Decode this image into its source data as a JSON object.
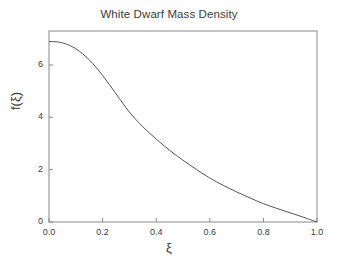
{
  "chart_data": {
    "type": "line",
    "title": "White Dwarf Mass Density",
    "xlabel": "ξ",
    "ylabel": "f(ξ)",
    "xlim": [
      0.0,
      1.0
    ],
    "ylim": [
      0.0,
      7.3
    ],
    "grid": false,
    "legend": null,
    "xticks": [
      0.0,
      0.2,
      0.4,
      0.6,
      0.8,
      1.0
    ],
    "xticklabels": [
      "0.0",
      "0.2",
      "0.4",
      "0.6",
      "0.8",
      "1.0"
    ],
    "yticks": [
      0,
      2,
      4,
      6
    ],
    "yticklabels": [
      "0",
      "2",
      "4",
      "6"
    ],
    "series": [
      {
        "name": "mass density",
        "color": "#555555",
        "x": [
          0.0,
          0.05,
          0.1,
          0.15,
          0.2,
          0.25,
          0.3,
          0.35,
          0.4,
          0.45,
          0.5,
          0.55,
          0.6,
          0.65,
          0.7,
          0.75,
          0.8,
          0.85,
          0.9,
          0.95,
          1.0
        ],
        "y": [
          6.9,
          6.85,
          6.62,
          6.2,
          5.6,
          4.9,
          4.2,
          3.64,
          3.17,
          2.74,
          2.36,
          2.01,
          1.68,
          1.4,
          1.15,
          0.92,
          0.7,
          0.52,
          0.35,
          0.18,
          0.0
        ]
      }
    ]
  },
  "figure": {
    "background_color": "#ffffff",
    "axes_color": "#888888",
    "text_color": "#3c3c3c"
  }
}
